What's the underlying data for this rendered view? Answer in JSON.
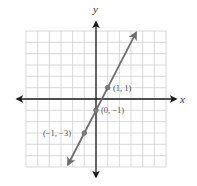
{
  "chart_data": {
    "type": "line",
    "title": "",
    "xlabel": "x",
    "ylabel": "y",
    "xlim": [
      -6,
      6
    ],
    "ylim": [
      -6,
      6
    ],
    "grid": true,
    "grid_step": 1,
    "equation": "y = 2x - 1",
    "series": [
      {
        "name": "line",
        "slope": 2,
        "intercept": -1,
        "color": "#6e6e6e",
        "x_extent": [
          -2.4,
          3.43
        ]
      }
    ],
    "points": [
      {
        "x": 1,
        "y": 1,
        "label": "(1, 1)"
      },
      {
        "x": 0,
        "y": -1,
        "label": "(0, −1)"
      },
      {
        "x": -1,
        "y": -3,
        "label": "(−1, −3)"
      }
    ]
  },
  "labels": {
    "x_axis": "x",
    "y_axis": "y",
    "p1": "(1, 1)",
    "p2": "(0, −1)",
    "p3": "(−1, −3)"
  },
  "colors": {
    "grid": "#cfcfcf",
    "axis": "#1a1a1a",
    "line": "#6e6e6e",
    "label": "#555555"
  }
}
